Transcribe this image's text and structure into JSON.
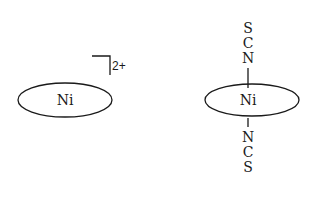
{
  "diagram": {
    "left": {
      "center_label": "Ni",
      "charge": "2+"
    },
    "right": {
      "center_label": "Ni",
      "top_ligand": [
        "S",
        "C",
        "N"
      ],
      "bottom_ligand": [
        "N",
        "C",
        "S"
      ]
    }
  }
}
